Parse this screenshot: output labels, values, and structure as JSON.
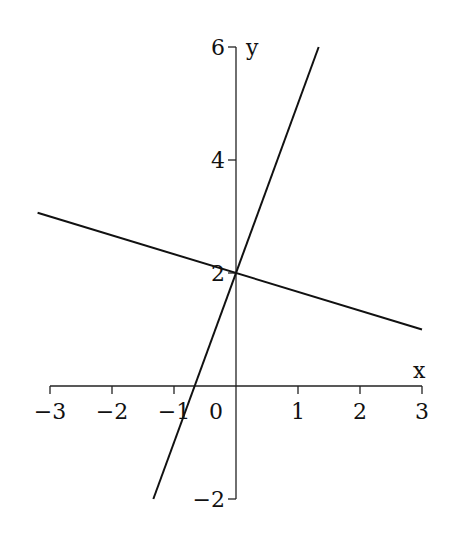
{
  "chart_data": {
    "type": "line",
    "title": "",
    "xlabel": "x",
    "ylabel": "y",
    "xlim": [
      -3,
      3
    ],
    "ylim": [
      -2,
      6
    ],
    "grid": false,
    "legend": null,
    "x_ticks": [
      -3,
      -2,
      -1,
      0,
      1,
      2,
      3
    ],
    "x_tick_labels": [
      "−3",
      "−2",
      "−1",
      "0",
      "1",
      "2",
      "3"
    ],
    "y_ticks": [
      -2,
      2,
      4,
      6
    ],
    "y_tick_labels": [
      "−2",
      "2",
      "4",
      "6"
    ],
    "series": [
      {
        "name": "steep line",
        "equation": "y = 3x + 2",
        "x": [
          -1.3333,
          1.3333
        ],
        "y": [
          -2,
          6
        ]
      },
      {
        "name": "shallow line",
        "equation": "y = -x/3 + 2",
        "x": [
          -3.2,
          3
        ],
        "y": [
          3.0667,
          1
        ]
      }
    ],
    "intersection": {
      "x": 0,
      "y": 2
    }
  }
}
